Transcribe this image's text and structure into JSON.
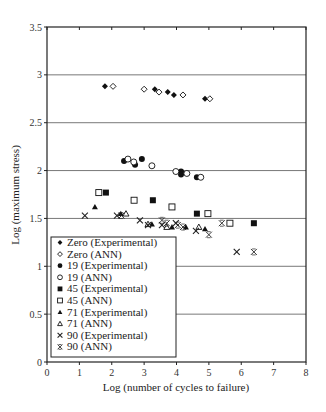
{
  "chart_data": {
    "type": "scatter",
    "title": "",
    "xlabel": "Log (number of cycles to failure)",
    "ylabel": "Log (maximum stress)",
    "xlim": [
      0,
      8
    ],
    "ylim": [
      0,
      3.5
    ],
    "xticks": [
      0,
      1,
      2,
      3,
      4,
      5,
      6,
      7,
      8
    ],
    "yticks": [
      0,
      0.5,
      1,
      1.5,
      2,
      2.5,
      3,
      3.5
    ],
    "ytick_labels": [
      "0",
      "0.5",
      "1",
      "1.5",
      "2",
      "2.5",
      "3",
      "3.5"
    ],
    "grid": "horizontal",
    "legend_position": "lower-left inside",
    "series": [
      {
        "name": "Zero (Experimental)",
        "marker": "diamond-filled",
        "points": [
          [
            1.79,
            2.88
          ],
          [
            3.33,
            2.85
          ],
          [
            3.73,
            2.82
          ],
          [
            3.92,
            2.79
          ],
          [
            4.88,
            2.75
          ]
        ]
      },
      {
        "name": "Zero (ANN)",
        "marker": "diamond-open",
        "points": [
          [
            2.04,
            2.88
          ],
          [
            3.0,
            2.85
          ],
          [
            3.46,
            2.82
          ],
          [
            4.2,
            2.79
          ],
          [
            5.03,
            2.75
          ]
        ]
      },
      {
        "name": "19 (Experimental)",
        "marker": "circle-filled",
        "points": [
          [
            2.38,
            2.1
          ],
          [
            2.72,
            2.06
          ],
          [
            2.93,
            2.12
          ],
          [
            4.14,
            1.99
          ],
          [
            4.14,
            1.96
          ],
          [
            4.63,
            1.93
          ]
        ]
      },
      {
        "name": "19 (ANN)",
        "marker": "circle-open",
        "points": [
          [
            2.5,
            2.12
          ],
          [
            2.68,
            2.09
          ],
          [
            3.24,
            2.05
          ],
          [
            3.98,
            1.99
          ],
          [
            4.32,
            1.97
          ],
          [
            4.75,
            1.93
          ]
        ]
      },
      {
        "name": "45 (Experimental)",
        "marker": "square-filled",
        "points": [
          [
            1.82,
            1.77
          ],
          [
            3.27,
            1.69
          ],
          [
            3.86,
            1.62
          ],
          [
            4.63,
            1.55
          ],
          [
            6.39,
            1.45
          ]
        ]
      },
      {
        "name": "45 (ANN)",
        "marker": "square-open",
        "points": [
          [
            1.6,
            1.77
          ],
          [
            2.69,
            1.69
          ],
          [
            3.86,
            1.62
          ],
          [
            4.97,
            1.55
          ],
          [
            5.65,
            1.45
          ]
        ]
      },
      {
        "name": "71 (Experimental)",
        "marker": "triangle-filled",
        "points": [
          [
            1.48,
            1.62
          ],
          [
            2.28,
            1.55
          ],
          [
            3.24,
            1.44
          ],
          [
            3.86,
            1.41
          ],
          [
            4.29,
            1.41
          ],
          [
            4.88,
            1.39
          ]
        ]
      },
      {
        "name": "71 (ANN)",
        "marker": "triangle-open",
        "points": [
          [
            2.44,
            1.55
          ],
          [
            3.12,
            1.44
          ],
          [
            3.7,
            1.41
          ],
          [
            4.69,
            1.41
          ]
        ]
      },
      {
        "name": "90 (Experimental)",
        "marker": "x",
        "points": [
          [
            1.17,
            1.53
          ],
          [
            2.16,
            1.53
          ],
          [
            2.87,
            1.48
          ],
          [
            3.12,
            1.43
          ],
          [
            3.55,
            1.43
          ],
          [
            3.98,
            1.45
          ],
          [
            4.6,
            1.37
          ],
          [
            5.86,
            1.15
          ]
        ]
      },
      {
        "name": "90 (ANN)",
        "marker": "x-thin",
        "points": [
          [
            2.3,
            1.53
          ],
          [
            3.55,
            1.48
          ],
          [
            3.7,
            1.45
          ],
          [
            4.2,
            1.41
          ],
          [
            4.04,
            1.43
          ],
          [
            5.0,
            1.33
          ],
          [
            5.4,
            1.45
          ],
          [
            6.39,
            1.15
          ]
        ]
      }
    ]
  }
}
